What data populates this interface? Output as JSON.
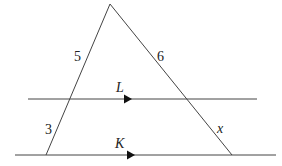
{
  "diagram": {
    "type": "triangle-with-parallel-lines",
    "colors": {
      "stroke": "#444444",
      "text": "#222222",
      "background": "#ffffff"
    },
    "labels": {
      "left_upper_segment": "5",
      "left_lower_segment": "3",
      "right_upper_segment": "6",
      "right_lower_segment": "x",
      "upper_line": "L",
      "lower_line": "K"
    },
    "geometry": {
      "apex": [
        110,
        4
      ],
      "base_left": [
        46,
        155
      ],
      "base_right": [
        232,
        155
      ],
      "line_L": {
        "y": 99,
        "x1": 28,
        "x2": 257
      },
      "line_K": {
        "y": 155,
        "x1": 15,
        "x2": 276
      }
    }
  }
}
